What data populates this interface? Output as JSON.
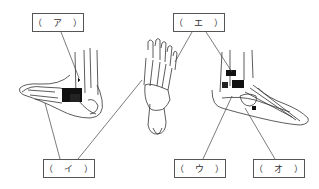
{
  "diagram": {
    "labels": [
      {
        "id": "a",
        "text": "（ ア ）",
        "x": 32,
        "y": 13
      },
      {
        "id": "e",
        "text": "（ エ ）",
        "x": 173,
        "y": 13
      },
      {
        "id": "i",
        "text": "（ イ ）",
        "x": 43,
        "y": 159
      },
      {
        "id": "u",
        "text": "（ ウ ）",
        "x": 174,
        "y": 159
      },
      {
        "id": "o",
        "text": "（ オ ）",
        "x": 253,
        "y": 159
      }
    ],
    "views": [
      "medial-view",
      "dorsal-view",
      "lateral-view"
    ],
    "colors": {
      "line": "#333333",
      "fill": "#111111",
      "box_border": "#555555"
    }
  }
}
